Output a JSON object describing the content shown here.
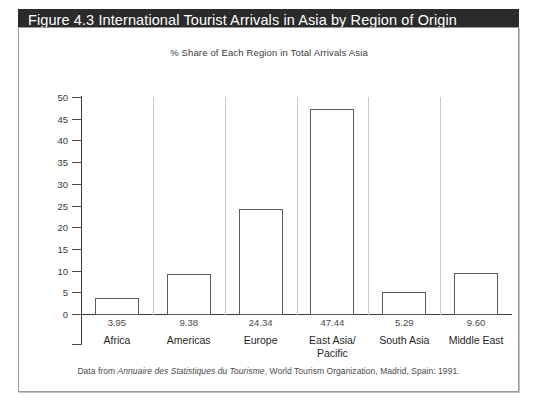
{
  "figure": {
    "title": "Figure 4.3  International Tourist Arrivals in Asia by Region of Origin",
    "subtitle": "% Share of Each Region in Total Arrivals Asia",
    "source_prefix": "Data from ",
    "source_italic": "Annuaire des Statistiques du Tourisme",
    "source_suffix": ", World Tourism Organization, Madrid, Spain: 1991.",
    "title_bg": "#2b2b2b",
    "title_fg": "#ffffff",
    "bar_fill": "#ffffff",
    "bar_stroke": "#5c5c5c",
    "axis_color": "#3a3a3a"
  },
  "chart_data": {
    "type": "bar",
    "title": "Figure 4.3  International Tourist Arrivals in Asia by Region of Origin",
    "subtitle": "% Share of Each Region in Total Arrivals Asia",
    "xlabel": "",
    "ylabel": "",
    "ylim": [
      0,
      50
    ],
    "ytick_step": 5,
    "grid": false,
    "legend": null,
    "categories": [
      "Africa",
      "Americas",
      "Europe",
      "East Asia/\nPacific",
      "South Asia",
      "Middle East"
    ],
    "values": [
      3.95,
      9.38,
      24.34,
      47.44,
      5.29,
      9.6
    ],
    "value_labels": [
      "3.95",
      "9.38",
      "24.34",
      "47.44",
      "5.29",
      "9.60"
    ],
    "ytick_labels": [
      "50",
      "45",
      "40",
      "35",
      "30",
      "25",
      "20",
      "15",
      "10",
      "5",
      "0"
    ],
    "ytick_values": [
      50,
      45,
      40,
      35,
      30,
      25,
      20,
      15,
      10,
      5,
      0
    ],
    "annotations": [
      "Data from Annuaire des Statistiques du Tourisme, World Tourism Organization, Madrid, Spain: 1991."
    ]
  }
}
